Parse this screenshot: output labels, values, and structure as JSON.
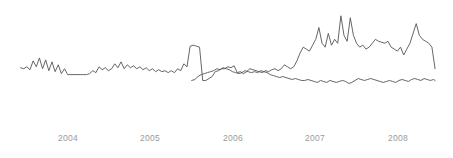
{
  "chart_data": {
    "type": "line",
    "title": "",
    "subtitle": "",
    "xlabel": "",
    "ylabel": "",
    "grid": false,
    "legend_position": "none",
    "background_color": "#ffffff",
    "line_color": "#555555",
    "tick_label_color": "#9a9a9a",
    "x_tick_labels": [
      "2004",
      "2005",
      "2006",
      "2007",
      "2008"
    ],
    "x_tick_positions": [
      68,
      150,
      233,
      315,
      398
    ],
    "xlim": [
      2003.4,
      2008.75
    ],
    "ylim": [
      0,
      100
    ],
    "axis_visible": false,
    "series": [
      {
        "name": "upper-series",
        "color": "#555555",
        "x": [
          2003.42,
          2003.46,
          2003.5,
          2003.54,
          2003.58,
          2003.62,
          2003.66,
          2003.7,
          2003.74,
          2003.78,
          2003.82,
          2003.86,
          2003.9,
          2003.94,
          2003.98,
          2004.02,
          2004.06,
          2004.1,
          2004.14,
          2004.18,
          2004.22,
          2004.26,
          2004.3,
          2004.34,
          2004.38,
          2004.42,
          2004.46,
          2004.5,
          2004.54,
          2004.58,
          2004.62,
          2004.66,
          2004.7,
          2004.74,
          2004.78,
          2004.82,
          2004.86,
          2004.9,
          2004.94,
          2004.98,
          2005.02,
          2005.06,
          2005.1,
          2005.14,
          2005.18,
          2005.22,
          2005.26,
          2005.3,
          2005.34,
          2005.38,
          2005.42,
          2005.46,
          2005.5,
          2005.54,
          2005.58,
          2005.62,
          2005.66,
          2005.7,
          2005.74,
          2005.78,
          2005.82,
          2005.86,
          2005.9,
          2005.94,
          2005.98,
          2006.02,
          2006.06,
          2006.1,
          2006.14,
          2006.18,
          2006.22,
          2006.26,
          2006.3,
          2006.34,
          2006.38,
          2006.42,
          2006.46,
          2006.5,
          2006.54,
          2006.58,
          2006.62,
          2006.66,
          2006.7,
          2006.74,
          2006.78,
          2006.82,
          2006.86,
          2006.9,
          2006.94,
          2006.98,
          2007.02,
          2007.06,
          2007.1,
          2007.14,
          2007.18,
          2007.22,
          2007.26,
          2007.3,
          2007.34,
          2007.38,
          2007.42,
          2007.46,
          2007.5,
          2007.54,
          2007.58,
          2007.62,
          2007.66,
          2007.7,
          2007.74,
          2007.78,
          2007.82,
          2007.86,
          2007.9,
          2007.94,
          2007.98,
          2008.02,
          2008.06,
          2008.1,
          2008.14,
          2008.18,
          2008.22,
          2008.26,
          2008.3,
          2008.34,
          2008.38,
          2008.42,
          2008.46,
          2008.5,
          2008.54,
          2008.58,
          2008.62,
          2008.66,
          2008.7
        ],
        "y": [
          37,
          36,
          38,
          35,
          44,
          38,
          47,
          36,
          45,
          34,
          43,
          33,
          40,
          31,
          36,
          30,
          30,
          30,
          30,
          30,
          30,
          30,
          31,
          34,
          32,
          38,
          35,
          37,
          34,
          36,
          41,
          37,
          43,
          36,
          40,
          37,
          39,
          36,
          38,
          35,
          37,
          34,
          36,
          33,
          35,
          33,
          34,
          32,
          34,
          32,
          36,
          34,
          41,
          38,
          59,
          60,
          59,
          58,
          24,
          24,
          26,
          28,
          33,
          34,
          36,
          36,
          38,
          37,
          39,
          32,
          33,
          31,
          33,
          36,
          35,
          34,
          33,
          32,
          34,
          33,
          35,
          36,
          34,
          36,
          40,
          38,
          36,
          38,
          44,
          52,
          58,
          56,
          54,
          60,
          66,
          78,
          62,
          58,
          72,
          60,
          66,
          62,
          90,
          70,
          64,
          88,
          70,
          62,
          58,
          60,
          56,
          58,
          62,
          66,
          64,
          63,
          62,
          64,
          58,
          56,
          54,
          58,
          50,
          56,
          62,
          72,
          82,
          70,
          66,
          64,
          62,
          58,
          36
        ]
      },
      {
        "name": "lower-series",
        "color": "#555555",
        "x": [
          2005.6,
          2005.64,
          2005.68,
          2005.72,
          2005.76,
          2005.8,
          2005.84,
          2005.88,
          2005.92,
          2005.96,
          2006.0,
          2006.04,
          2006.08,
          2006.12,
          2006.16,
          2006.2,
          2006.24,
          2006.28,
          2006.32,
          2006.36,
          2006.4,
          2006.44,
          2006.48,
          2006.52,
          2006.56,
          2006.6,
          2006.64,
          2006.68,
          2006.72,
          2006.76,
          2006.8,
          2006.84,
          2006.88,
          2006.92,
          2006.96,
          2007.0,
          2007.04,
          2007.08,
          2007.12,
          2007.16,
          2007.2,
          2007.24,
          2007.28,
          2007.32,
          2007.36,
          2007.4,
          2007.44,
          2007.48,
          2007.52,
          2007.56,
          2007.6,
          2007.64,
          2007.68,
          2007.72,
          2007.76,
          2007.8,
          2007.84,
          2007.88,
          2007.92,
          2007.96,
          2008.0,
          2008.04,
          2008.08,
          2008.12,
          2008.16,
          2008.2,
          2008.24,
          2008.28,
          2008.32,
          2008.36,
          2008.4,
          2008.44,
          2008.48,
          2008.52,
          2008.56,
          2008.6,
          2008.64,
          2008.68,
          2008.7
        ],
        "y": [
          24,
          25,
          28,
          30,
          31,
          32,
          33,
          34,
          36,
          35,
          37,
          36,
          35,
          33,
          32,
          31,
          32,
          34,
          33,
          32,
          33,
          32,
          34,
          33,
          32,
          30,
          29,
          28,
          27,
          28,
          27,
          26,
          25,
          26,
          25,
          24,
          24,
          25,
          24,
          23,
          22,
          24,
          23,
          22,
          24,
          23,
          22,
          23,
          24,
          23,
          21,
          22,
          24,
          26,
          25,
          24,
          25,
          26,
          25,
          24,
          23,
          22,
          23,
          24,
          23,
          22,
          24,
          25,
          24,
          23,
          25,
          26,
          25,
          24,
          26,
          25,
          24,
          25,
          24
        ]
      }
    ]
  }
}
